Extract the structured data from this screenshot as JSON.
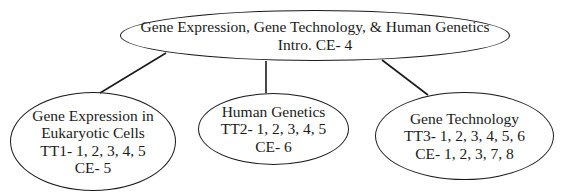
{
  "diagram": {
    "type": "concept-map",
    "root": {
      "lines": [
        "Gene Expression, Gene Technology, & Human Genetics",
        "Intro. CE- 4"
      ]
    },
    "children": [
      {
        "lines": [
          "Gene Expression in",
          "Eukaryotic Cells",
          "TT1- 1, 2, 3, 4, 5",
          "CE- 5"
        ]
      },
      {
        "lines": [
          "Human Genetics",
          "TT2- 1, 2, 3, 4, 5",
          "CE- 6"
        ]
      },
      {
        "lines": [
          "Gene Technology",
          "TT3- 1, 2, 3, 4, 5, 6",
          "CE- 1, 2, 3, 7, 8"
        ]
      }
    ],
    "colors": {
      "stroke": "#1a1a1a",
      "background": "#ffffff",
      "text": "#1a1a1a"
    }
  }
}
